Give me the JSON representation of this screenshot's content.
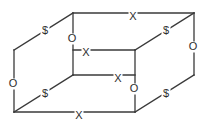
{
  "diagram": {
    "type": "cube-wireframe",
    "line_color": "#3a3a3a",
    "label_color": "#2e2e2e",
    "background_color": "#ffffff",
    "vertices": {
      "front_bottom_left": {
        "x": 14,
        "y": 112
      },
      "front_bottom_right": {
        "x": 135,
        "y": 112
      },
      "front_top_left": {
        "x": 14,
        "y": 50
      },
      "front_top_right": {
        "x": 135,
        "y": 50
      },
      "back_bottom_left": {
        "x": 73,
        "y": 75
      },
      "back_bottom_right": {
        "x": 194,
        "y": 75
      },
      "back_top_left": {
        "x": 73,
        "y": 13
      },
      "back_top_right": {
        "x": 194,
        "y": 13
      }
    },
    "edges": [
      {
        "id": "top-back-horizontal",
        "label": "X",
        "orientation": "horizontal",
        "x1": 73,
        "y1": 13,
        "x2": 194,
        "y2": 13,
        "lx": 133,
        "ly": 17
      },
      {
        "id": "upper-front-horizontal",
        "label": "X",
        "orientation": "horizontal",
        "x1": 73,
        "y1": 50,
        "x2": 135,
        "y2": 50,
        "lx": 86,
        "ly": 53
      },
      {
        "id": "lower-back-horizontal",
        "label": "X",
        "orientation": "horizontal",
        "x1": 73,
        "y1": 75,
        "x2": 135,
        "y2": 75,
        "lx": 118,
        "ly": 79
      },
      {
        "id": "bottom-front-horizontal",
        "label": "X",
        "orientation": "horizontal",
        "x1": 14,
        "y1": 112,
        "x2": 135,
        "y2": 112,
        "lx": 79,
        "ly": 116
      },
      {
        "id": "left-front-vertical",
        "label": "O",
        "orientation": "vertical",
        "x1": 14,
        "y1": 50,
        "x2": 14,
        "y2": 112,
        "lx": 13,
        "ly": 84
      },
      {
        "id": "left-back-vertical",
        "label": "O",
        "orientation": "vertical",
        "x1": 73,
        "y1": 13,
        "x2": 73,
        "y2": 75,
        "lx": 72,
        "ly": 39
      },
      {
        "id": "right-front-vertical",
        "label": "O",
        "orientation": "vertical",
        "x1": 135,
        "y1": 50,
        "x2": 135,
        "y2": 112,
        "lx": 134,
        "ly": 89
      },
      {
        "id": "right-back-vertical",
        "label": "O",
        "orientation": "vertical",
        "x1": 194,
        "y1": 13,
        "x2": 194,
        "y2": 75,
        "lx": 193,
        "ly": 47
      },
      {
        "id": "top-left-diagonal",
        "label": "$",
        "orientation": "diagonal",
        "x1": 14,
        "y1": 50,
        "x2": 73,
        "y2": 13,
        "lx": 45,
        "ly": 31
      },
      {
        "id": "top-right-diagonal",
        "label": "$",
        "orientation": "diagonal",
        "x1": 135,
        "y1": 50,
        "x2": 194,
        "y2": 13,
        "lx": 166,
        "ly": 31
      },
      {
        "id": "bottom-left-diagonal",
        "label": "$",
        "orientation": "diagonal",
        "x1": 14,
        "y1": 112,
        "x2": 73,
        "y2": 75,
        "lx": 45,
        "ly": 94
      },
      {
        "id": "bottom-right-diagonal",
        "label": "$",
        "orientation": "diagonal",
        "x1": 135,
        "y1": 112,
        "x2": 194,
        "y2": 75,
        "lx": 166,
        "ly": 94
      }
    ],
    "label_legend": {
      "x_label": "X",
      "o_label": "O",
      "dollar_label": "$"
    }
  }
}
